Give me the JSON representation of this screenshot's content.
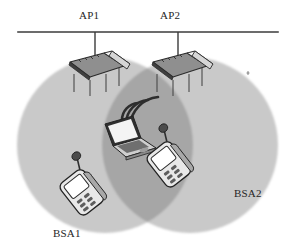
{
  "figure": {
    "background_color": "#ffffff"
  },
  "backbone": {
    "name": "distribution-system-backbone",
    "color": "#3b3b3b",
    "x_start": 18,
    "x_end": 278,
    "y": 32,
    "thickness": 1.6
  },
  "access_points": [
    {
      "label": "AP1",
      "drop_cable_x": 95,
      "drop_cable_y_top": 32,
      "drop_cable_y_bottom": 58,
      "device_center_x": 96,
      "device_center_y": 72
    },
    {
      "label": "AP2",
      "drop_cable_x": 178,
      "drop_cable_y_top": 32,
      "drop_cable_y_bottom": 58,
      "device_center_x": 179,
      "device_center_y": 72
    }
  ],
  "coverage_areas": [
    {
      "label": "BSA1",
      "center_x": 105,
      "center_y": 145,
      "radius": 88,
      "fill": "#c9c9c9"
    },
    {
      "label": "BSA2",
      "center_x": 190,
      "center_y": 145,
      "radius": 88,
      "fill": "#c9c9c9"
    }
  ],
  "overlap_region": {
    "name": "bsa-overlap",
    "fill": "#a6a6a6"
  },
  "stations": [
    {
      "type": "laptop",
      "name": "laptop-station",
      "center_x": 124,
      "center_y": 140,
      "has_signal": true,
      "signal_arcs": 3
    },
    {
      "type": "handheld",
      "name": "handheld-station-left",
      "center_x": 82,
      "center_y": 191,
      "rotation_deg": -38
    },
    {
      "type": "handheld",
      "name": "handheld-station-right",
      "center_x": 169,
      "center_y": 163,
      "rotation_deg": -38
    }
  ],
  "colors": {
    "line": "#3b3b3b",
    "device_outline": "#2b2b2b",
    "device_fill_light": "#efefef",
    "device_fill_mid": "#b9b9b9",
    "device_fill_dark": "#6e6e6e",
    "bsa_light": "#c9c9c9",
    "bsa_overlap": "#a6a6a6",
    "text": "#262626"
  },
  "labels": {
    "ap1": "AP1",
    "ap2": "AP2",
    "bsa1": "BSA1",
    "bsa2": "BSA2"
  },
  "speck": {
    "name": "scan-artifact-speck",
    "x": 248,
    "y": 73
  }
}
